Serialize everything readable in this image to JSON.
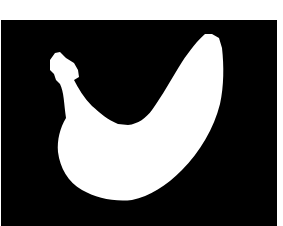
{
  "image": {
    "kind": "segmentation-mask",
    "subject": "banana silhouette",
    "colors": {
      "page": "#ffffff",
      "background": "#000000",
      "foreground": "#ffffff"
    }
  }
}
